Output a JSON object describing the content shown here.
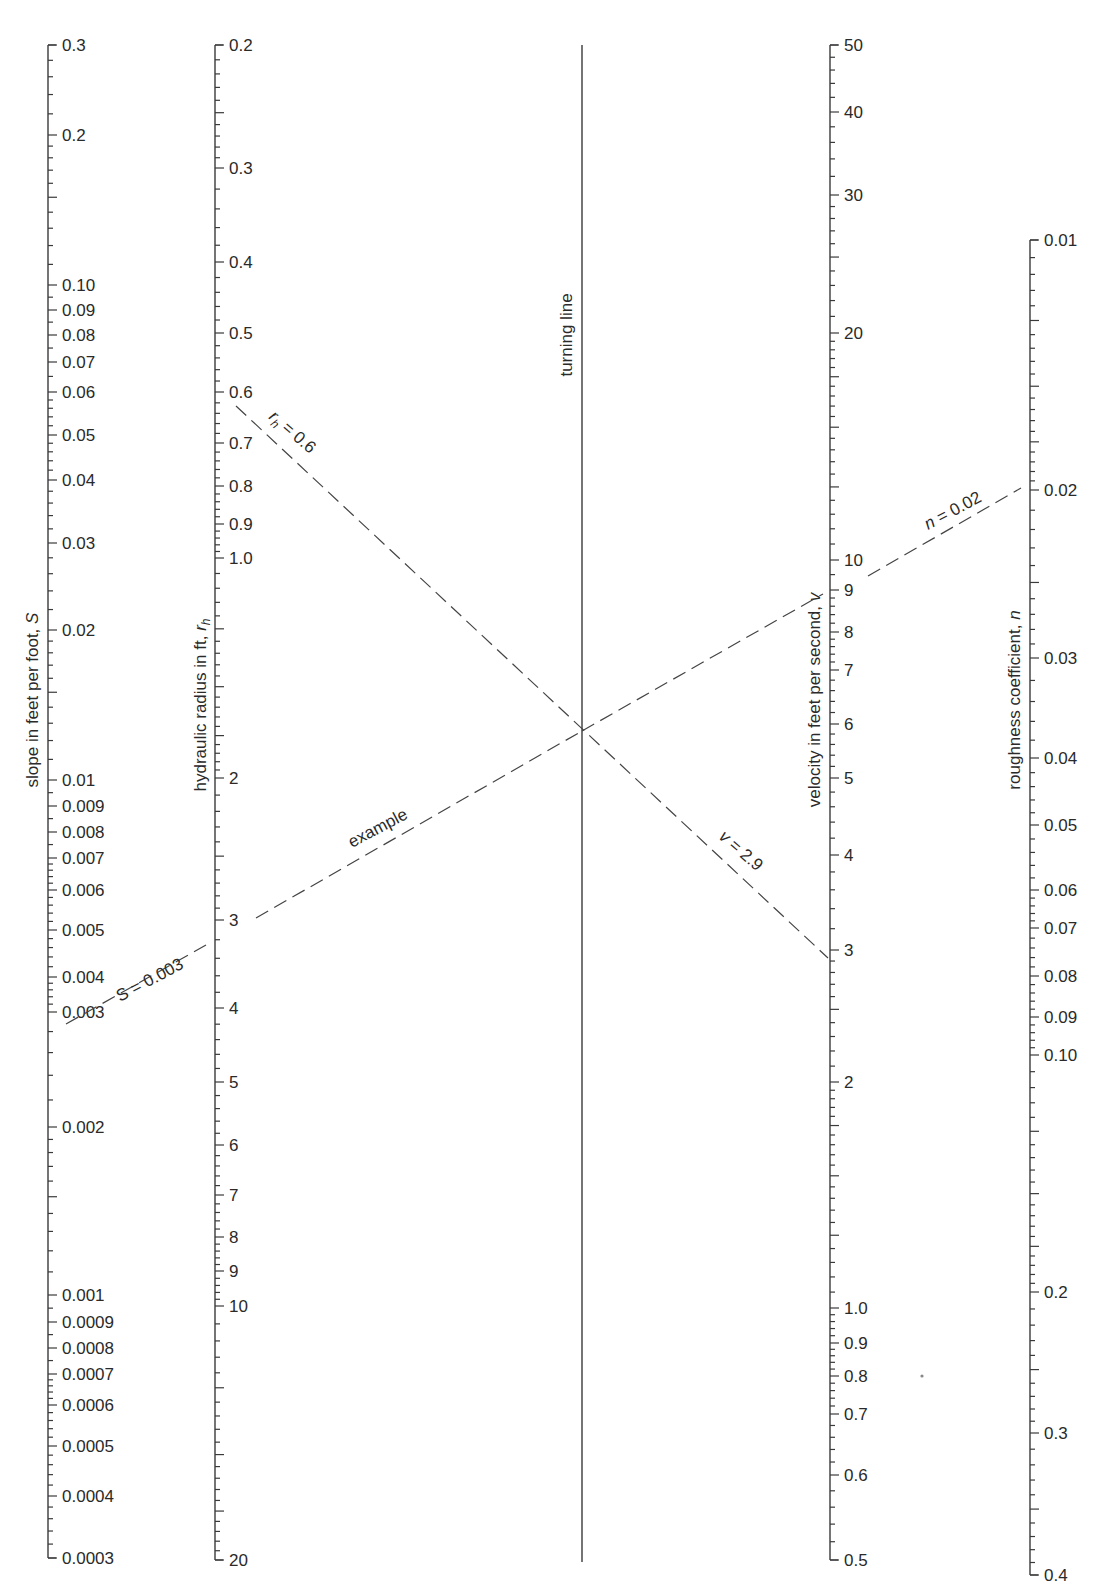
{
  "chart_data": {
    "type": "nomogram",
    "title": "",
    "scales": [
      {
        "id": "slope",
        "label": "slope in feet per foot, S",
        "label_main": "slope in feet per foot, ",
        "label_var": "S",
        "x": 48,
        "log": true,
        "range": [
          0.3,
          0.0003
        ],
        "ticks": [
          {
            "v": "0.3",
            "y": 45
          },
          {
            "v": "0.2",
            "y": 135
          },
          {
            "v": "0.10",
            "y": 285
          },
          {
            "v": "0.09",
            "y": 310
          },
          {
            "v": "0.08",
            "y": 335
          },
          {
            "v": "0.07",
            "y": 362
          },
          {
            "v": "0.06",
            "y": 392
          },
          {
            "v": "0.05",
            "y": 435
          },
          {
            "v": "0.04",
            "y": 480
          },
          {
            "v": "0.03",
            "y": 543
          },
          {
            "v": "0.02",
            "y": 630
          },
          {
            "v": "0.01",
            "y": 780
          },
          {
            "v": "0.009",
            "y": 806
          },
          {
            "v": "0.008",
            "y": 832
          },
          {
            "v": "0.007",
            "y": 858
          },
          {
            "v": "0.006",
            "y": 890
          },
          {
            "v": "0.005",
            "y": 930
          },
          {
            "v": "0.004",
            "y": 977
          },
          {
            "v": "0.003",
            "y": 1012
          },
          {
            "v": "0.002",
            "y": 1127
          },
          {
            "v": "0.001",
            "y": 1295
          },
          {
            "v": "0.0009",
            "y": 1322
          },
          {
            "v": "0.0008",
            "y": 1348
          },
          {
            "v": "0.0007",
            "y": 1374
          },
          {
            "v": "0.0006",
            "y": 1405
          },
          {
            "v": "0.0005",
            "y": 1446
          },
          {
            "v": "0.0004",
            "y": 1496
          },
          {
            "v": "0.0003",
            "y": 1558
          }
        ],
        "title_pos": {
          "x": 38,
          "y": 700
        }
      },
      {
        "id": "hydraulic_radius",
        "label": "hydraulic radius in ft, rh",
        "label_main": "hydraulic radius in ft, ",
        "label_var": "r",
        "label_sub": "h",
        "x": 215,
        "log": true,
        "range": [
          0.2,
          20
        ],
        "ticks": [
          {
            "v": "0.2",
            "y": 45
          },
          {
            "v": "0.3",
            "y": 168
          },
          {
            "v": "0.4",
            "y": 262
          },
          {
            "v": "0.5",
            "y": 333
          },
          {
            "v": "0.6",
            "y": 392
          },
          {
            "v": "0.7",
            "y": 443
          },
          {
            "v": "0.8",
            "y": 486
          },
          {
            "v": "0.9",
            "y": 524
          },
          {
            "v": "1.0",
            "y": 558
          },
          {
            "v": "2",
            "y": 778
          },
          {
            "v": "3",
            "y": 920
          },
          {
            "v": "4",
            "y": 1008
          },
          {
            "v": "5",
            "y": 1082
          },
          {
            "v": "6",
            "y": 1145
          },
          {
            "v": "7",
            "y": 1195
          },
          {
            "v": "8",
            "y": 1237
          },
          {
            "v": "9",
            "y": 1271
          },
          {
            "v": "10",
            "y": 1306
          },
          {
            "v": "20",
            "y": 1560
          }
        ],
        "title_pos": {
          "x": 206,
          "y": 705
        }
      },
      {
        "id": "turning_line",
        "label": "turning line",
        "x": 582,
        "y_top": 45,
        "y_bottom": 1562,
        "title_pos": {
          "x": 572,
          "y": 335
        }
      },
      {
        "id": "velocity",
        "label": "velocity in feet per second, v",
        "label_main": "velocity in feet per second, ",
        "label_var": "v",
        "x": 830,
        "log": true,
        "range": [
          50,
          0.5
        ],
        "ticks": [
          {
            "v": "50",
            "y": 45
          },
          {
            "v": "40",
            "y": 112
          },
          {
            "v": "30",
            "y": 195
          },
          {
            "v": "20",
            "y": 333
          },
          {
            "v": "10",
            "y": 560
          },
          {
            "v": "9",
            "y": 590
          },
          {
            "v": "8",
            "y": 632
          },
          {
            "v": "7",
            "y": 670
          },
          {
            "v": "6",
            "y": 724
          },
          {
            "v": "5",
            "y": 778
          },
          {
            "v": "4",
            "y": 855
          },
          {
            "v": "3",
            "y": 950
          },
          {
            "v": "2",
            "y": 1082
          },
          {
            "v": "1.0",
            "y": 1308
          },
          {
            "v": "0.9",
            "y": 1343
          },
          {
            "v": "0.8",
            "y": 1376
          },
          {
            "v": "0.7",
            "y": 1414
          },
          {
            "v": "0.6",
            "y": 1475
          },
          {
            "v": "0.5",
            "y": 1560
          }
        ],
        "title_pos": {
          "x": 820,
          "y": 700
        }
      },
      {
        "id": "roughness",
        "label": "roughness coefficient, n",
        "label_main": "roughness coefficient, ",
        "label_var": "n",
        "x": 1030,
        "log": true,
        "range": [
          0.01,
          0.4
        ],
        "ticks": [
          {
            "v": "0.01",
            "y": 240
          },
          {
            "v": "0.02",
            "y": 490
          },
          {
            "v": "0.03",
            "y": 658
          },
          {
            "v": "0.04",
            "y": 758
          },
          {
            "v": "0.05",
            "y": 825
          },
          {
            "v": "0.06",
            "y": 890
          },
          {
            "v": "0.07",
            "y": 928
          },
          {
            "v": "0.08",
            "y": 976
          },
          {
            "v": "0.09",
            "y": 1017
          },
          {
            "v": "0.10",
            "y": 1055
          },
          {
            "v": "0.2",
            "y": 1292
          },
          {
            "v": "0.3",
            "y": 1433
          },
          {
            "v": "0.4",
            "y": 1575
          }
        ],
        "title_pos": {
          "x": 1020,
          "y": 700
        }
      }
    ],
    "example": {
      "label": "example",
      "inputs": {
        "S": 0.003,
        "rh": 0.6,
        "n": 0.02
      },
      "result": {
        "v": 2.9
      },
      "annotations": [
        {
          "id": "s-ann",
          "text": "S = 0.003",
          "var": "S",
          "rest": " = 0.003",
          "x": 120,
          "y": 1002,
          "angle": -28
        },
        {
          "id": "rh-ann",
          "text": "rh = 0.6",
          "var": "r",
          "sub": "h",
          "rest": " = 0.6",
          "x": 268,
          "y": 418,
          "angle": 41
        },
        {
          "id": "v-ann",
          "text": "v = 2.9",
          "var": "v",
          "rest": " = 2.9",
          "x": 718,
          "y": 838,
          "angle": 41
        },
        {
          "id": "n-ann",
          "text": "n = 0.02",
          "var": "n",
          "rest": " = 0.02",
          "x": 928,
          "y": 530,
          "angle": -28
        },
        {
          "id": "example-ann",
          "text": "example",
          "x": 352,
          "y": 848,
          "angle": -28
        }
      ],
      "dashed_lines": [
        {
          "id": "slope-segment",
          "x1": 66,
          "y1": 1024,
          "x2": 206,
          "y2": 945
        },
        {
          "id": "example-line-left",
          "x1": 256,
          "y1": 918,
          "x2": 582,
          "y2": 731
        },
        {
          "id": "example-line-right",
          "x1": 582,
          "y1": 731,
          "x2": 823,
          "y2": 594
        },
        {
          "id": "roughness-segment",
          "x1": 868,
          "y1": 576,
          "x2": 1021,
          "y2": 488
        },
        {
          "id": "rh-v-line",
          "x1": 236,
          "y1": 406,
          "x2": 828,
          "y2": 958
        }
      ]
    },
    "minor_tick_density": "fine logarithmic subdivisions between labeled ticks"
  }
}
